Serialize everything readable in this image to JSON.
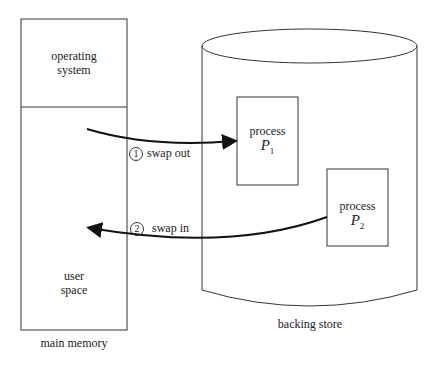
{
  "main_memory": {
    "os_label_line1": "operating",
    "os_label_line2": "system",
    "user_label_line1": "user",
    "user_label_line2": "space",
    "caption": "main memory"
  },
  "backing_store": {
    "caption": "backing store",
    "process1": {
      "label": "process",
      "name": "P",
      "subscript": "1"
    },
    "process2": {
      "label": "process",
      "name": "P",
      "subscript": "2"
    }
  },
  "steps": [
    {
      "number": "1",
      "label": "swap out"
    },
    {
      "number": "2",
      "label": "swap in"
    }
  ]
}
